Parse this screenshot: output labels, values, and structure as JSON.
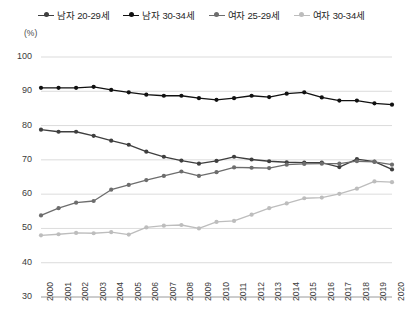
{
  "chart_data": {
    "type": "line",
    "title": "",
    "xlabel": "",
    "ylabel": "(%)",
    "unit_label": "(%)",
    "ylim": [
      30,
      100
    ],
    "yticks": [
      30,
      40,
      50,
      60,
      70,
      80,
      90,
      100
    ],
    "grid": true,
    "legend_position": "top-center",
    "categories": [
      "2000",
      "2001",
      "2002",
      "2003",
      "2004",
      "2005",
      "2006",
      "2007",
      "2008",
      "2009",
      "2010",
      "2011",
      "2012",
      "2013",
      "2014",
      "2015",
      "2016",
      "2017",
      "2018",
      "2019",
      "2020"
    ],
    "series": [
      {
        "name": "남자 20-29세",
        "color": "#3f3f3f",
        "values": [
          78.8,
          78.2,
          78.2,
          77.0,
          75.6,
          74.4,
          72.4,
          70.9,
          69.8,
          68.9,
          69.7,
          70.9,
          70.1,
          69.6,
          69.3,
          69.2,
          69.2,
          67.9,
          70.2,
          69.5,
          67.2
        ]
      },
      {
        "name": "남자 30-34세",
        "color": "#111111",
        "values": [
          91.0,
          91.0,
          91.0,
          91.3,
          90.4,
          89.7,
          89.0,
          88.7,
          88.7,
          88.0,
          87.5,
          88.0,
          88.7,
          88.3,
          89.3,
          89.7,
          88.2,
          87.3,
          87.3,
          86.5,
          86.1
        ]
      },
      {
        "name": "여자 25-29세",
        "color": "#6d6d6d",
        "values": [
          53.8,
          55.9,
          57.5,
          58.0,
          61.3,
          62.7,
          64.1,
          65.3,
          66.6,
          65.3,
          66.4,
          67.8,
          67.7,
          67.6,
          68.6,
          68.8,
          68.9,
          68.9,
          69.6,
          69.4,
          68.6
        ]
      },
      {
        "name": "여자 30-34세",
        "color": "#bdbdbd",
        "values": [
          48.0,
          48.3,
          48.7,
          48.6,
          48.9,
          48.2,
          50.3,
          50.8,
          51.0,
          50.0,
          51.9,
          52.2,
          54.0,
          55.9,
          57.3,
          58.8,
          59.0,
          60.1,
          61.6,
          63.7,
          63.5
        ]
      }
    ]
  }
}
